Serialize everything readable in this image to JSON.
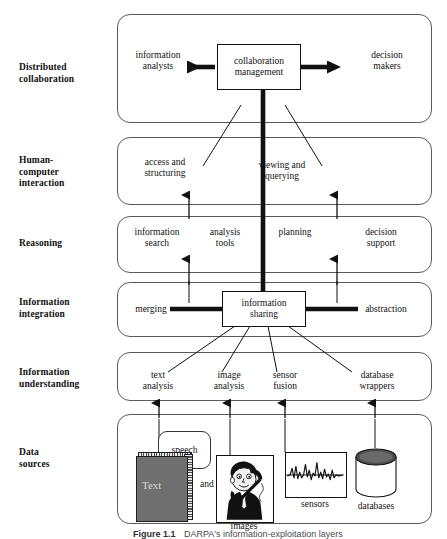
{
  "figure": {
    "caption_bold": "Figure 1.1",
    "caption_rest": "DARPA's information-exploitation layers",
    "colors": {
      "band_stroke": "#5a5a5a",
      "box_stroke": "#111111",
      "text": "#111111",
      "book_cover": "#6f6f6f",
      "background": "#ffffff"
    }
  },
  "tiers": [
    {
      "id": "distributed-collaboration",
      "label": "Distributed\ncollaboration"
    },
    {
      "id": "human-computer-interaction",
      "label": "Human-\ncomputer\ninteraction"
    },
    {
      "id": "reasoning",
      "label": "Reasoning"
    },
    {
      "id": "information-integration",
      "label": "Information\nintegration"
    },
    {
      "id": "information-understanding",
      "label": "Information\nunderstanding"
    },
    {
      "id": "data-sources",
      "label": "Data\nsources"
    }
  ],
  "nodes": {
    "collaboration_management": "collaboration\nmanagement",
    "information_analysts": "information\nanalysts",
    "decision_makers": "decision\nmakers",
    "access_and_structuring": "access and\nstructuring",
    "viewing_and_querying": "viewing and\nquerying",
    "information_search": "information\nsearch",
    "analysis_tools": "analysis\ntools",
    "planning": "planning",
    "decision_support": "decision\nsupport",
    "merging": "merging",
    "information_sharing": "information\nsharing",
    "abstraction": "abstraction",
    "text_analysis": "text\nanalysis",
    "image_analysis": "image\nanalysis",
    "sensor_fusion": "sensor\nfusion",
    "database_wrappers": "database\nwrappers"
  },
  "data_sources": {
    "text_label": "Text",
    "speech_label": "speech",
    "and_label": "and",
    "images_label": "images",
    "sensors_label": "sensors",
    "databases_label": "databases"
  },
  "icons": {
    "book": "book-icon",
    "speech_bubble": "speech-bubble-icon",
    "person_photo": "person-photo-icon",
    "waveform": "waveform-icon",
    "database_cylinder": "database-cylinder-icon",
    "arrow_up": "arrow-up-icon",
    "arrow_left": "arrow-left-icon",
    "arrow_right": "arrow-right-icon"
  }
}
